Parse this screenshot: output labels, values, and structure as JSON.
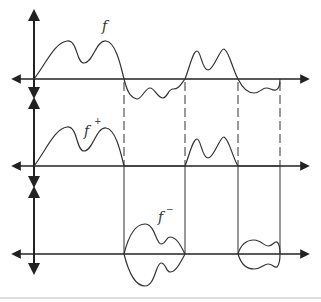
{
  "diagram": {
    "panels": [
      {
        "name": "f",
        "label": "f",
        "label_sup": ""
      },
      {
        "name": "f-plus",
        "label": "f",
        "label_sup": "+"
      },
      {
        "name": "f-minus",
        "label": "f",
        "label_sup": "−"
      }
    ],
    "zero_crossings_px": [
      124,
      185,
      238,
      280
    ],
    "colors": {
      "line": "#333333",
      "axis": "#222222",
      "divider": "#bbbbbb"
    }
  }
}
